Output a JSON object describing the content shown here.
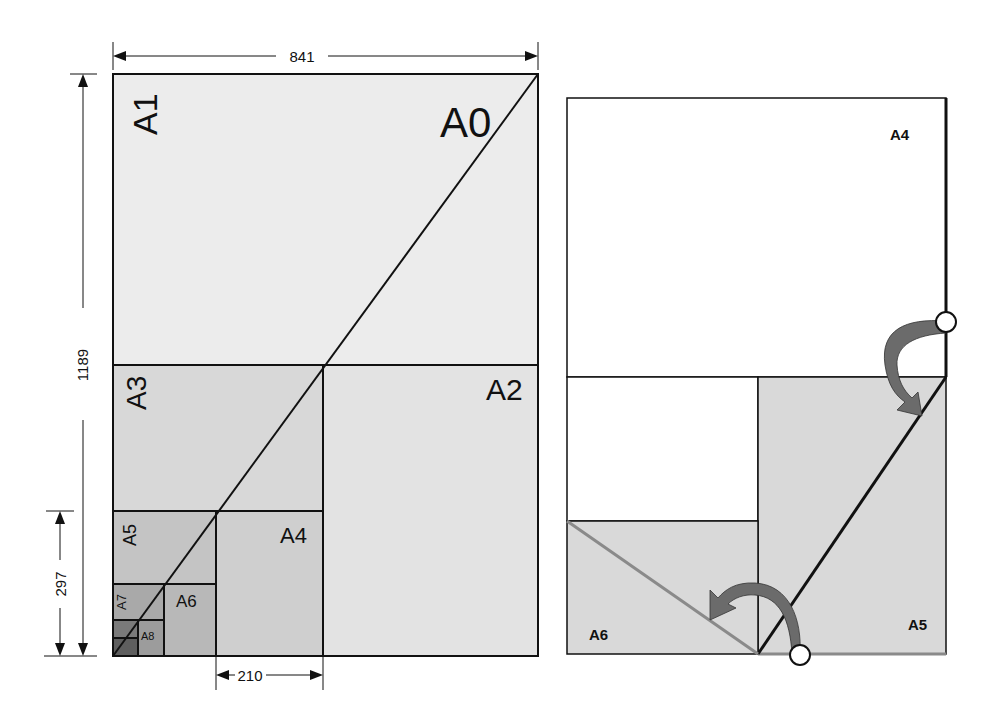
{
  "figure": {
    "left_diagram": {
      "title": "A-series paper size subdivision",
      "dimensions": {
        "width_a0": "841",
        "height_a0": "1189",
        "height_a4": "297",
        "width_a4": "210"
      },
      "labels": {
        "a0": "A0",
        "a1": "A1",
        "a2": "A2",
        "a3": "A3",
        "a4": "A4",
        "a5": "A5",
        "a6": "A6",
        "a7": "A7",
        "a8": "A8"
      }
    },
    "right_diagram": {
      "title": "Folding A4 into A5 and A6",
      "labels": {
        "a4": "A4",
        "a5": "A5",
        "a6": "A6"
      }
    },
    "colors": {
      "a0_fill": "#ececec",
      "a2_fill": "#e3e3e3",
      "a3_fill": "#d8d8d8",
      "a4_fill": "#cfcfcf",
      "a5_fill": "#c4c4c4",
      "a6_fill": "#b8b8b8",
      "a7_fill": "#a9a9a9",
      "a8_fill": "#9c9c9c",
      "a9_fill": "#7a7a7a",
      "a10_fill": "#5e5e5e",
      "fold_fill": "#d9d9d9",
      "arrow_fill": "#6b6b6b",
      "line": "#111111",
      "fold_line_gray": "#8a8a8a"
    }
  }
}
